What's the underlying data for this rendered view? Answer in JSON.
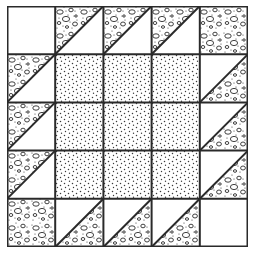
{
  "grid": {
    "rows": 5,
    "cols": 5
  },
  "colors": {
    "line": "#2a2a2a",
    "background": "#ffffff",
    "dot": "#3a3a3a"
  },
  "fabrics": {
    "white": "plain white",
    "pebble": "pebble / stone print",
    "stipple": "fine dot stipple"
  },
  "cells": [
    [
      "white",
      "hst-a",
      "hst-a",
      "hst-a",
      "pebble"
    ],
    [
      "hst-a",
      "stipple",
      "stipple",
      "stipple",
      "hst-b"
    ],
    [
      "hst-a",
      "stipple",
      "stipple",
      "stipple",
      "hst-b"
    ],
    [
      "hst-a",
      "stipple",
      "stipple",
      "stipple",
      "hst-b"
    ],
    [
      "pebble",
      "hst-b",
      "hst-b",
      "hst-b",
      "white"
    ]
  ],
  "legend": {
    "hst-a": "half-square triangle, diagonal bottom-left to top-right, pebble upper-left, white lower-right",
    "hst-b": "half-square triangle, diagonal bottom-left to top-right, white upper-left, pebble lower-right"
  }
}
